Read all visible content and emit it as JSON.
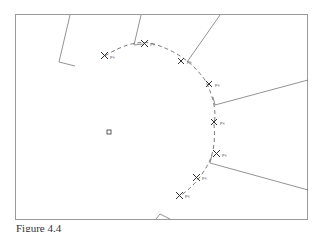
{
  "figure": {
    "caption": "Figure 4.4",
    "center_marker": {
      "x": 109,
      "y": 132,
      "shape": "square"
    },
    "points": [
      {
        "label": "pₖ",
        "x": 105,
        "y": 56
      },
      {
        "label": "pₖ",
        "x": 144,
        "y": 43
      },
      {
        "label": "pₖ",
        "x": 181,
        "y": 61
      },
      {
        "label": "pₖ",
        "x": 209,
        "y": 84
      },
      {
        "label": "pₖ",
        "x": 214,
        "y": 122
      },
      {
        "label": "pₖ",
        "x": 216,
        "y": 154
      },
      {
        "label": "pₖ",
        "x": 196,
        "y": 177
      },
      {
        "label": "pₖ",
        "x": 180,
        "y": 195
      }
    ]
  }
}
